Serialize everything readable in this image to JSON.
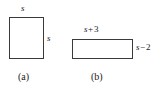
{
  "figure": {
    "background_color": "#ffffff",
    "stroke_color": "#3a3a3a",
    "fill_color": "#ffffff",
    "parts": [
      {
        "caption": "(a)",
        "shape": "square",
        "labels": {
          "top": {
            "variable": "s",
            "operator": "",
            "operand": ""
          },
          "right": {
            "variable": "s",
            "operator": "",
            "operand": ""
          }
        }
      },
      {
        "caption": "(b)",
        "shape": "rectangle",
        "labels": {
          "top": {
            "variable": "s",
            "operator": "+",
            "operand": "3"
          },
          "right": {
            "variable": "s",
            "operator": "−",
            "operand": "2"
          }
        }
      }
    ]
  },
  "labels": {
    "square_top": "s",
    "square_right": "s",
    "rect_top_var": "s",
    "rect_top_op": "+",
    "rect_top_operand": "3",
    "rect_right_var": "s",
    "rect_right_op": "−",
    "rect_right_operand": "2"
  },
  "captions": {
    "a": "(a)",
    "b": "(b)"
  }
}
